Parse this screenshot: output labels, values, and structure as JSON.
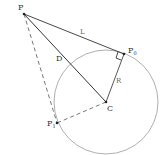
{
  "diagram": {
    "title": "",
    "points": {
      "P": {
        "label": "P",
        "x": 24,
        "y": 14
      },
      "P0": {
        "label": "P",
        "sub": "0",
        "x": 124,
        "y": 54
      },
      "P1": {
        "label": "P",
        "sub": "1",
        "x": 57,
        "y": 123
      },
      "C": {
        "label": "C",
        "x": 106,
        "y": 102
      }
    },
    "segments": {
      "L": {
        "label": "L"
      },
      "D": {
        "label": "D"
      },
      "R": {
        "label": "R"
      }
    },
    "circle": {
      "center": "C",
      "radius": 52
    },
    "colors": {
      "line": "#333333",
      "circle": "#999999",
      "dashed": "#666666",
      "label": "#333333"
    }
  }
}
